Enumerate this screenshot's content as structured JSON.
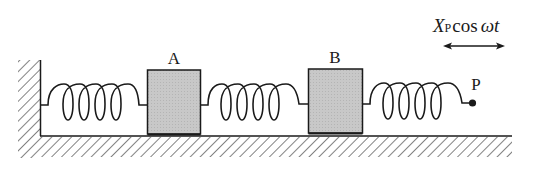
{
  "diagram": {
    "type": "spring-mass system",
    "colors": {
      "ink": "#1a1a1a",
      "block_fill": "#c4c4c4",
      "background": "#ffffff"
    },
    "masses": [
      {
        "id": "A",
        "label": "A"
      },
      {
        "id": "B",
        "label": "B"
      }
    ],
    "springs": [
      {
        "id": "spring-wall-A",
        "from": "wall",
        "to": "A"
      },
      {
        "id": "spring-A-B",
        "from": "A",
        "to": "B"
      },
      {
        "id": "spring-B-P",
        "from": "B",
        "to": "P"
      }
    ],
    "point": {
      "label": "P"
    },
    "excitation": {
      "symbol": "X",
      "subscript": "P",
      "function": "cos",
      "argument": "ωt",
      "arrow": "double-headed horizontal"
    }
  }
}
